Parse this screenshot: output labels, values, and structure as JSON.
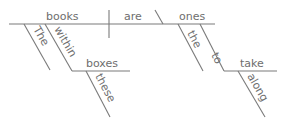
{
  "diagram": {
    "type": "sentence-diagram",
    "sentence": "The books within these boxes are the ones to take along",
    "line_color": "#7a7a7a",
    "text_color": "#6e6e6e",
    "words": {
      "subject": "books",
      "verb": "are",
      "object": "ones",
      "mod_the_subject": "The",
      "prep_within": "within",
      "prep_object": "boxes",
      "mod_these": "these",
      "mod_the_object": "the",
      "inf_to": "to",
      "inf_verb": "take",
      "adverb_along": "along"
    }
  }
}
